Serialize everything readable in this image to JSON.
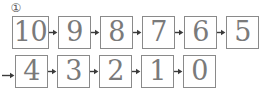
{
  "diagram": {
    "marker_label": "①",
    "marker_name": "step-number-one",
    "colors": {
      "box_border": "#8a8a8a",
      "digit": "#7a7a7a",
      "arrow": "#3b3b3b",
      "background": "#ffffff"
    },
    "rows": [
      {
        "row_label": "row-1",
        "has_leading_arrow": false,
        "cells": [
          {
            "value": "10"
          },
          {
            "value": "9"
          },
          {
            "value": "8"
          },
          {
            "value": "7"
          },
          {
            "value": "6"
          },
          {
            "value": "5"
          }
        ]
      },
      {
        "row_label": "row-2",
        "has_leading_arrow": true,
        "cells": [
          {
            "value": "4"
          },
          {
            "value": "3"
          },
          {
            "value": "2"
          },
          {
            "value": "1"
          },
          {
            "value": "0"
          }
        ]
      }
    ]
  }
}
